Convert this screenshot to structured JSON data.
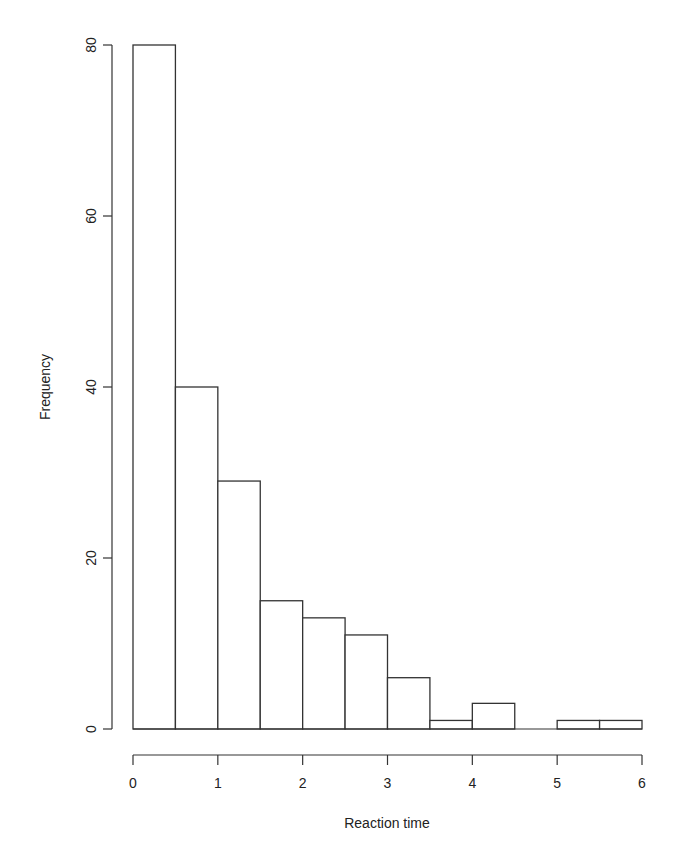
{
  "chart_data": {
    "type": "bar",
    "subtype": "histogram",
    "title": "",
    "xlabel": "Reaction time",
    "ylabel": "Frequency",
    "bin_edges": [
      0,
      0.5,
      1,
      1.5,
      2,
      2.5,
      3,
      3.5,
      4,
      4.5,
      5,
      5.5,
      6
    ],
    "categories": [
      "0-0.5",
      "0.5-1",
      "1-1.5",
      "1.5-2",
      "2-2.5",
      "2.5-3",
      "3-3.5",
      "3.5-4",
      "4-4.5",
      "4.5-5",
      "5-5.5",
      "5.5-6"
    ],
    "values": [
      80,
      40,
      29,
      15,
      13,
      11,
      6,
      1,
      3,
      0,
      1,
      1
    ],
    "xlim": [
      0,
      6
    ],
    "ylim": [
      0,
      80
    ],
    "x_ticks": [
      "0",
      "1",
      "2",
      "3",
      "4",
      "5",
      "6"
    ],
    "y_ticks": [
      "0",
      "20",
      "40",
      "60",
      "80"
    ],
    "grid": false,
    "legend": null,
    "colors": {
      "bar_fill": "#ffffff",
      "bar_stroke": "#333333"
    }
  }
}
